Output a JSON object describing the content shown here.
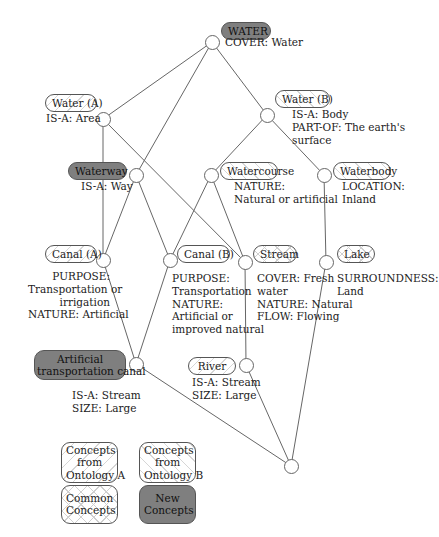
{
  "concepts": {
    "water": {
      "label": "WATER",
      "props": "COVER: Water",
      "origin": "new"
    },
    "water_a": {
      "label": "Water (A)",
      "props": "IS-A: Area",
      "origin": "ontology_a"
    },
    "water_b": {
      "label": "Water (B)",
      "props": "IS-A: Body\nPART-OF: The earth's\nsurface",
      "origin": "ontology_b"
    },
    "waterway": {
      "label": "Waterway",
      "props": "IS-A: Way",
      "origin": "new"
    },
    "watercourse": {
      "label": "Watercourse",
      "props": "NATURE:\nNatural or artificial",
      "origin": "ontology_b"
    },
    "waterbody": {
      "label": "Waterbody",
      "props": "LOCATION:\nInland",
      "origin": "ontology_b"
    },
    "canal_a": {
      "label": "Canal (A)",
      "props": "PURPOSE:\nTransportation or\nirrigation\nNATURE: Artificial",
      "origin": "ontology_a"
    },
    "canal_b": {
      "label": "Canal (B)",
      "props": "PURPOSE:\nTransportation\nNATURE:\nArtificial or\nimproved natural",
      "origin": "ontology_b"
    },
    "stream": {
      "label": "Stream",
      "props": "COVER: Fresh\nwater\nNATURE: Natural\nFLOW: Flowing",
      "origin": "common"
    },
    "lake": {
      "label": "Lake",
      "props": "SURROUNDNESS:\nLand",
      "origin": "common"
    },
    "artificial_canal": {
      "label": "Artificial\ntransportation canal",
      "props": "IS-A: Stream\nSIZE: Large",
      "origin": "new"
    },
    "river": {
      "label": "River",
      "props": "IS-A: Stream\nSIZE: Large",
      "origin": "ontology_a"
    }
  },
  "legend": {
    "ontology_a": "Concepts\nfrom\nOntology A",
    "ontology_b": "Concepts\nfrom\nOntology B",
    "common": "Common\nConcepts",
    "new": "New\nConcepts"
  },
  "colors": {
    "new_fill": "#7f7f7f",
    "line": "#666666",
    "hatch": "#d6d6d6"
  }
}
